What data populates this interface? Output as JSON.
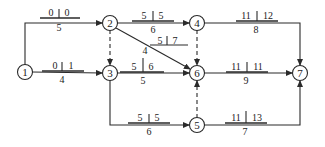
{
  "diagram": {
    "type": "activity-on-arrow network (time-scaled parameters)",
    "nodes": [
      {
        "id": "1",
        "label": "1",
        "x": 25,
        "y": 72
      },
      {
        "id": "2",
        "label": "2",
        "x": 110,
        "y": 23
      },
      {
        "id": "3",
        "label": "3",
        "x": 110,
        "y": 73
      },
      {
        "id": "4",
        "label": "4",
        "x": 197,
        "y": 23
      },
      {
        "id": "5",
        "label": "5",
        "x": 197,
        "y": 125
      },
      {
        "id": "6",
        "label": "6",
        "x": 197,
        "y": 73
      },
      {
        "id": "7",
        "label": "7",
        "x": 300,
        "y": 73
      }
    ],
    "edges": [
      {
        "from": "1",
        "to": "2",
        "duration": "5",
        "es": "0",
        "ls": "0",
        "dashed": false
      },
      {
        "from": "1",
        "to": "3",
        "duration": "4",
        "es": "0",
        "ls": "1",
        "dashed": false
      },
      {
        "from": "2",
        "to": "3",
        "dashed": true
      },
      {
        "from": "2",
        "to": "4",
        "duration": "6",
        "es": "5",
        "ls": "5",
        "dashed": false
      },
      {
        "from": "2",
        "to": "6",
        "duration": "4",
        "es": "5",
        "ls": "7",
        "dashed": false
      },
      {
        "from": "3",
        "to": "6",
        "duration": "5",
        "es": "5",
        "ls": "6",
        "dashed": false
      },
      {
        "from": "3",
        "to": "5",
        "duration": "6",
        "es": "5",
        "ls": "5",
        "dashed": false
      },
      {
        "from": "4",
        "to": "6",
        "dashed": true
      },
      {
        "from": "4",
        "to": "7",
        "duration": "8",
        "es": "11",
        "ls": "12",
        "dashed": false
      },
      {
        "from": "5",
        "to": "6",
        "dashed": true
      },
      {
        "from": "6",
        "to": "7",
        "duration": "9",
        "es": "11",
        "ls": "11",
        "dashed": false
      },
      {
        "from": "5",
        "to": "7",
        "duration": "7",
        "es": "11",
        "ls": "13",
        "dashed": false
      }
    ]
  },
  "labels": {
    "e12": {
      "es": "0",
      "ls": "0",
      "d": "5"
    },
    "e13": {
      "es": "0",
      "ls": "1",
      "d": "4"
    },
    "e24": {
      "es": "5",
      "ls": "5",
      "d": "6"
    },
    "e26": {
      "es": "5",
      "ls": "7",
      "d": "4"
    },
    "e36": {
      "es": "5",
      "ls": "6",
      "d": "5"
    },
    "e35": {
      "es": "5",
      "ls": "5",
      "d": "6"
    },
    "e47": {
      "es": "11",
      "ls": "12",
      "d": "8"
    },
    "e67": {
      "es": "11",
      "ls": "11",
      "d": "9"
    },
    "e57": {
      "es": "11",
      "ls": "13",
      "d": "7"
    }
  },
  "node_labels": {
    "n1": "1",
    "n2": "2",
    "n3": "3",
    "n4": "4",
    "n5": "5",
    "n6": "6",
    "n7": "7"
  }
}
